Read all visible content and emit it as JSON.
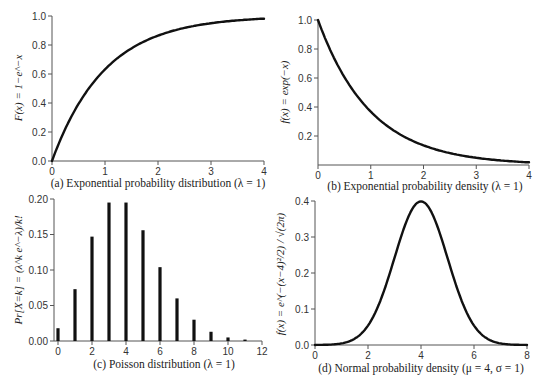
{
  "chart_data": [
    {
      "id": "a",
      "type": "line",
      "title": "(a) Exponential probability distribution (λ = 1)",
      "xlabel": "",
      "ylabel": "F(x) = 1−e^−x",
      "xlim": [
        0,
        4
      ],
      "ylim": [
        0,
        1.0
      ],
      "xticks": [
        0,
        1,
        2,
        3,
        4
      ],
      "yticks": [
        "0.0",
        "0.2",
        "0.4",
        "0.6",
        "0.8",
        "1.0"
      ],
      "x": [
        0,
        0.25,
        0.5,
        0.75,
        1,
        1.5,
        2,
        2.5,
        3,
        3.5,
        4
      ],
      "y": [
        0,
        0.221,
        0.393,
        0.528,
        0.632,
        0.777,
        0.865,
        0.918,
        0.95,
        0.97,
        0.982
      ],
      "grid": false
    },
    {
      "id": "b",
      "type": "line",
      "title": "(b) Exponential probability density (λ = 1)",
      "xlabel": "",
      "ylabel": "f(x) = exp(−x)",
      "xlim": [
        0,
        4
      ],
      "ylim": [
        0,
        1.0
      ],
      "xticks": [
        0,
        1,
        2,
        3,
        4
      ],
      "yticks": [
        "0.2",
        "0.4",
        "0.6",
        "0.8",
        "1.0"
      ],
      "x": [
        0,
        0.25,
        0.5,
        0.75,
        1,
        1.5,
        2,
        2.5,
        3,
        3.5,
        4
      ],
      "y": [
        1.0,
        0.779,
        0.607,
        0.472,
        0.368,
        0.223,
        0.135,
        0.082,
        0.05,
        0.03,
        0.018
      ],
      "grid": false
    },
    {
      "id": "c",
      "type": "bar",
      "title": "(c) Poisson distribution (λ = 1)",
      "xlabel": "",
      "ylabel": "Pr[X=k] = (λ^k e^−λ)/k!",
      "xlim": [
        0,
        12
      ],
      "ylim": [
        0,
        0.2
      ],
      "xticks": [
        0,
        2,
        4,
        6,
        8,
        10,
        12
      ],
      "yticks": [
        "0.00",
        "0.05",
        "0.10",
        "0.15",
        "0.20"
      ],
      "categories": [
        0,
        1,
        2,
        3,
        4,
        5,
        6,
        7,
        8,
        9,
        10,
        11
      ],
      "values": [
        0.018,
        0.073,
        0.147,
        0.195,
        0.195,
        0.156,
        0.104,
        0.06,
        0.03,
        0.013,
        0.005,
        0.002
      ],
      "grid": false
    },
    {
      "id": "d",
      "type": "line",
      "title": "(d) Normal probability density (μ = 4, σ = 1)",
      "xlabel": "",
      "ylabel": "f(x) = e^(−(x−4)²/2) / √(2π)",
      "xlim": [
        0,
        8
      ],
      "ylim": [
        0,
        0.4
      ],
      "xticks": [
        0,
        2,
        4,
        6,
        8
      ],
      "yticks": [
        "0.0",
        "0.1",
        "0.2",
        "0.3",
        "0.4"
      ],
      "mu": 4,
      "sigma": 1,
      "grid": false
    }
  ]
}
